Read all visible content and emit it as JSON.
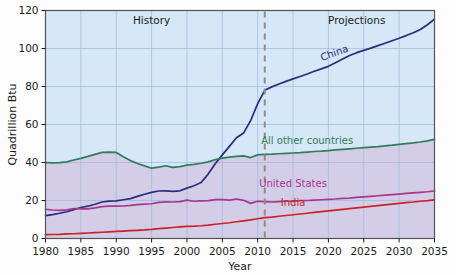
{
  "chart_data": {
    "type": "line",
    "title": "",
    "xlabel": "Year",
    "ylabel": "Quadrillion Btu",
    "xlim": [
      1980,
      2035
    ],
    "ylim": [
      0,
      120
    ],
    "xticks": [
      1980,
      1985,
      1990,
      1995,
      2000,
      2005,
      2010,
      2015,
      2020,
      2025,
      2030,
      2035
    ],
    "yticks": [
      0,
      20,
      40,
      60,
      80,
      100,
      120
    ],
    "grid": true,
    "legend_position": "inline-labels",
    "annotations": [
      {
        "text": "History",
        "x": 1995,
        "y": 113
      },
      {
        "text": "Projections",
        "x": 2024,
        "y": 113
      }
    ],
    "divider": {
      "x": 2011,
      "style": "dashed",
      "color": "#8c8c8c",
      "label": "history-projection-split"
    },
    "x": [
      1980,
      1981,
      1982,
      1983,
      1984,
      1985,
      1986,
      1987,
      1988,
      1989,
      1990,
      1991,
      1992,
      1993,
      1994,
      1995,
      1996,
      1997,
      1998,
      1999,
      2000,
      2001,
      2002,
      2003,
      2004,
      2005,
      2006,
      2007,
      2008,
      2009,
      2010,
      2011,
      2012,
      2013,
      2014,
      2015,
      2016,
      2017,
      2018,
      2019,
      2020,
      2021,
      2022,
      2023,
      2024,
      2025,
      2026,
      2027,
      2028,
      2029,
      2030,
      2031,
      2032,
      2033,
      2034,
      2035
    ],
    "series": [
      {
        "name": "China",
        "color": "#2b2b7f",
        "values": [
          12.0,
          12.6,
          13.3,
          14.1,
          15.2,
          16.3,
          17.0,
          18.0,
          19.2,
          19.7,
          19.8,
          20.4,
          21.0,
          22.2,
          23.3,
          24.3,
          25.0,
          25.1,
          24.8,
          25.1,
          26.5,
          27.8,
          29.5,
          33.9,
          39.3,
          44.0,
          48.5,
          53.0,
          55.5,
          62.0,
          71.0,
          78.0,
          79.8,
          81.3,
          82.7,
          84.0,
          85.3,
          86.6,
          88.0,
          89.3,
          90.6,
          92.5,
          94.5,
          96.3,
          97.8,
          99.0,
          100.2,
          101.5,
          102.8,
          104.1,
          105.4,
          106.8,
          108.3,
          110.0,
          112.5,
          115.5
        ]
      },
      {
        "name": "All other countries",
        "color": "#2e7d5b",
        "values": [
          40.0,
          39.8,
          39.9,
          40.3,
          41.3,
          42.2,
          43.2,
          44.3,
          45.3,
          45.5,
          45.3,
          43.0,
          41.0,
          39.5,
          38.2,
          37.0,
          37.6,
          38.3,
          37.4,
          37.8,
          38.6,
          39.0,
          39.6,
          40.3,
          41.5,
          42.3,
          42.8,
          43.2,
          43.5,
          42.6,
          44.0,
          44.3,
          44.4,
          44.6,
          44.8,
          45.0,
          45.2,
          45.5,
          45.8,
          46.0,
          46.3,
          46.6,
          46.9,
          47.2,
          47.5,
          47.8,
          48.1,
          48.4,
          48.8,
          49.1,
          49.5,
          49.9,
          50.3,
          50.8,
          51.4,
          52.2
        ]
      },
      {
        "name": "United States",
        "color": "#a8368f",
        "values": [
          15.4,
          15.0,
          14.8,
          15.1,
          15.8,
          15.6,
          15.6,
          16.1,
          16.8,
          17.0,
          17.0,
          17.1,
          17.4,
          17.8,
          18.1,
          18.3,
          19.0,
          19.3,
          19.2,
          19.4,
          20.2,
          19.6,
          19.8,
          19.9,
          20.5,
          20.5,
          20.2,
          20.8,
          20.1,
          18.5,
          19.6,
          19.4,
          19.2,
          19.4,
          19.6,
          19.7,
          19.9,
          20.0,
          20.2,
          20.4,
          20.6,
          20.8,
          21.1,
          21.3,
          21.6,
          21.9,
          22.2,
          22.5,
          22.8,
          23.1,
          23.4,
          23.7,
          24.0,
          24.3,
          24.6,
          25.0
        ]
      },
      {
        "name": "India",
        "color": "#cc2222",
        "values": [
          2.0,
          2.1,
          2.2,
          2.4,
          2.5,
          2.7,
          2.9,
          3.1,
          3.3,
          3.5,
          3.7,
          3.9,
          4.1,
          4.3,
          4.5,
          4.8,
          5.2,
          5.5,
          5.8,
          6.1,
          6.4,
          6.5,
          6.7,
          7.0,
          7.5,
          7.9,
          8.3,
          8.8,
          9.3,
          9.8,
          10.4,
          11.0,
          11.3,
          11.7,
          12.1,
          12.5,
          12.9,
          13.3,
          13.7,
          14.1,
          14.5,
          14.9,
          15.3,
          15.7,
          16.1,
          16.5,
          16.9,
          17.3,
          17.7,
          18.1,
          18.5,
          18.9,
          19.2,
          19.6,
          19.9,
          20.3
        ]
      }
    ],
    "series_labels": [
      {
        "name": "China",
        "x": 2021,
        "y": 96,
        "rotation": -20,
        "color": "#2b2b7f"
      },
      {
        "name": "All other countries",
        "x": 2017,
        "y": 50,
        "rotation": 0,
        "color": "#2e7d5b"
      },
      {
        "name": "United States",
        "x": 2015,
        "y": 27,
        "rotation": 0,
        "color": "#a8368f"
      },
      {
        "name": "India",
        "x": 2015,
        "y": 17,
        "rotation": 0,
        "color": "#cc2222"
      }
    ],
    "background": {
      "upper_fill": "#d6e7f7",
      "lower_fill": "#d3cde8",
      "band_boundary_series": "All other countries",
      "gridline_color": "#9fb9d6",
      "frame_color": "#555555"
    }
  }
}
